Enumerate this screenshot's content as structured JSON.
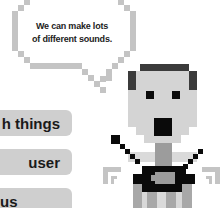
{
  "speech_bubble": {
    "line1": "We can make lots",
    "line2": "of different sounds."
  },
  "buttons": [
    {
      "label": "h things"
    },
    {
      "label": "user"
    },
    {
      "label": "us"
    }
  ],
  "colors": {
    "bubble_outline": "#c4c4c4",
    "hair": "#3b3b3b",
    "skin": "#d4d4d4",
    "black": "#0a0a0a",
    "neck": "#9c9c9c",
    "stripe_light": "#d8d8d8",
    "stripe_mid": "#a8a8a8",
    "button_bg": "#cfcfcf"
  }
}
